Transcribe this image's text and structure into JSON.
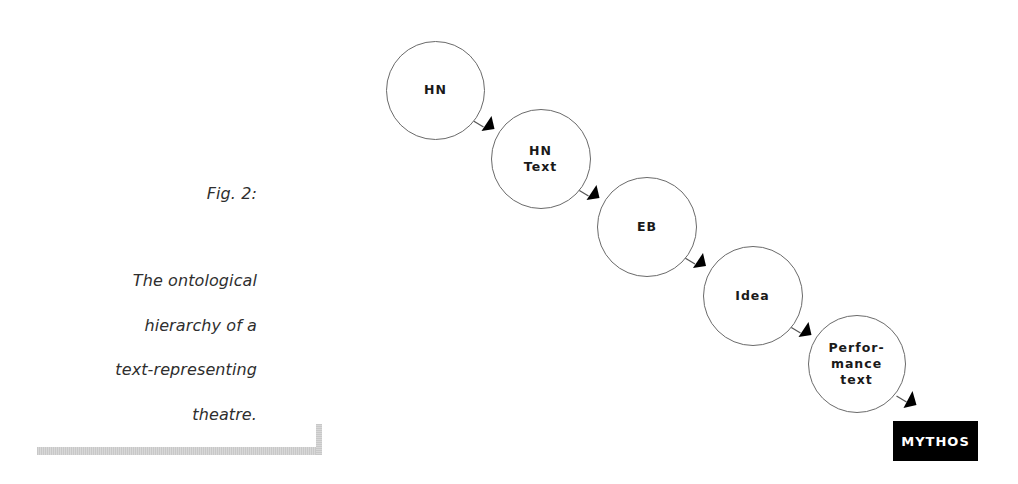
{
  "caption": {
    "figure_label": "Fig. 2:",
    "lines": [
      "The ontological",
      "hierarchy of a",
      "text-representing",
      "theatre."
    ]
  },
  "diagram": {
    "nodes": [
      {
        "id": "hn",
        "label": "HN",
        "cx": 435.5,
        "cy": 90,
        "r": 49.5
      },
      {
        "id": "hn-text",
        "label": "HN\nText",
        "cx": 540.5,
        "cy": 159,
        "r": 50
      },
      {
        "id": "eb",
        "label": "EB",
        "cx": 647,
        "cy": 227,
        "r": 50
      },
      {
        "id": "idea",
        "label": "Idea",
        "cx": 752.5,
        "cy": 296,
        "r": 50
      },
      {
        "id": "performance-text",
        "label": "Perfor-\nmance\ntext",
        "cx": 856.5,
        "cy": 364,
        "r": 49
      }
    ],
    "terminal": {
      "label": "MYTHOS"
    },
    "edges": [
      {
        "from": "hn",
        "to": "hn-text"
      },
      {
        "from": "hn-text",
        "to": "eb"
      },
      {
        "from": "eb",
        "to": "idea"
      },
      {
        "from": "idea",
        "to": "performance-text"
      },
      {
        "from": "performance-text",
        "to": "mythos"
      }
    ],
    "colors": {
      "node_stroke": "#6a6a6a",
      "arrow": "#000000",
      "terminal_bg": "#000000",
      "terminal_text": "#ffffff",
      "bracket": "#cccccc"
    }
  }
}
